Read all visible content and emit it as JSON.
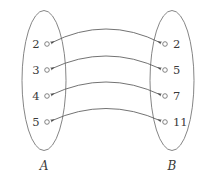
{
  "figure": {
    "type": "bipartite-mapping-diagram",
    "background_color": "#ffffff",
    "stroke_color": "#555555",
    "text_color": "#3a3a3a"
  },
  "sets": {
    "left": {
      "name": "A",
      "ellipse": {
        "cx": 44,
        "cy": 80.5,
        "rx": 22,
        "ry": 70
      },
      "label_position": {
        "x": 44,
        "y": 170
      },
      "elements": [
        {
          "value": "2",
          "node_x": 47,
          "node_y": 44,
          "label_x": 36,
          "label_y": 48
        },
        {
          "value": "3",
          "node_x": 47,
          "node_y": 70,
          "label_x": 36,
          "label_y": 74
        },
        {
          "value": "4",
          "node_x": 47,
          "node_y": 96,
          "label_x": 36,
          "label_y": 100
        },
        {
          "value": "5",
          "node_x": 47,
          "node_y": 122,
          "label_x": 36,
          "label_y": 126
        }
      ]
    },
    "right": {
      "name": "B",
      "ellipse": {
        "cx": 172,
        "cy": 80.5,
        "rx": 22,
        "ry": 70
      },
      "label_position": {
        "x": 172,
        "y": 170
      },
      "elements": [
        {
          "value": "2",
          "node_x": 165,
          "node_y": 44,
          "label_x": 173,
          "label_y": 48
        },
        {
          "value": "5",
          "node_x": 165,
          "node_y": 70,
          "label_x": 173,
          "label_y": 74
        },
        {
          "value": "7",
          "node_x": 165,
          "node_y": 96,
          "label_x": 173,
          "label_y": 100
        },
        {
          "value": "11",
          "node_x": 165,
          "node_y": 122,
          "label_x": 173,
          "label_y": 126
        }
      ]
    }
  },
  "mappings": [
    {
      "from": "2",
      "to": "2",
      "x1": 51,
      "y1": 43,
      "x2": 161,
      "y2": 43,
      "peak_y": 15,
      "bidirectional": true
    },
    {
      "from": "3",
      "to": "5",
      "x1": 51,
      "y1": 69,
      "x2": 161,
      "y2": 69,
      "peak_y": 43,
      "bidirectional": true
    },
    {
      "from": "4",
      "to": "7",
      "x1": 51,
      "y1": 95,
      "x2": 161,
      "y2": 95,
      "peak_y": 69,
      "bidirectional": true
    },
    {
      "from": "5",
      "to": "11",
      "x1": 51,
      "y1": 121,
      "x2": 161,
      "y2": 121,
      "peak_y": 96,
      "bidirectional": true
    }
  ],
  "node_radius": 2.3
}
